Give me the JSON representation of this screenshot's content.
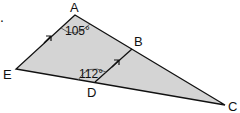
{
  "figure": {
    "vertices": {
      "A": {
        "label": "A"
      },
      "B": {
        "label": "B"
      },
      "C": {
        "label": "C"
      },
      "D": {
        "label": "D"
      },
      "E": {
        "label": "E"
      }
    },
    "angles": {
      "angle_at_A": "105°",
      "angle_at_D": "112°"
    },
    "parallel_marks": [
      "AE",
      "DB"
    ],
    "leading_mark": ".",
    "colors": {
      "fill": "#d4d4d4",
      "stroke": "#111111"
    }
  }
}
